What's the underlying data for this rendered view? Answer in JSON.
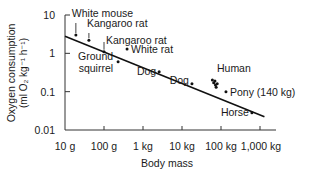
{
  "chart_data": {
    "type": "scatter",
    "title": "",
    "xlabel": "Body mass",
    "ylabel_line1": "Oxygen consumption",
    "ylabel_line2": "(ml O₂ kg⁻¹ h⁻¹)",
    "x_scale": "log",
    "y_scale": "log",
    "xlim_kg": [
      0.01,
      1300
    ],
    "ylim": [
      0.01,
      10
    ],
    "x_ticks": [
      {
        "value_kg": 0.01,
        "label": "10 g"
      },
      {
        "value_kg": 0.1,
        "label": "100 g"
      },
      {
        "value_kg": 1,
        "label": "1 kg"
      },
      {
        "value_kg": 10,
        "label": "10 kg"
      },
      {
        "value_kg": 100,
        "label": "100 kg"
      },
      {
        "value_kg": 1000,
        "label": "1,000 kg"
      }
    ],
    "y_ticks": [
      {
        "value": 10,
        "label": "10"
      },
      {
        "value": 1,
        "label": "1"
      },
      {
        "value": 0.1,
        "label": "0.1"
      },
      {
        "value": 0.01,
        "label": "0.01"
      }
    ],
    "grid": false,
    "legend": "none",
    "points": [
      {
        "label": "White mouse",
        "mass_kg": 0.019,
        "o2": 3.0
      },
      {
        "label": "Kangaroo rat",
        "mass_kg": 0.041,
        "o2": 2.2
      },
      {
        "label": "Kangaroo rat",
        "mass_kg": 0.1,
        "o2": 1.1
      },
      {
        "label": "White rat",
        "mass_kg": 0.39,
        "o2": 1.3
      },
      {
        "label": "Ground squirrel",
        "mass_kg": 0.23,
        "o2": 0.6
      },
      {
        "label": "Dog",
        "mass_kg": 2.6,
        "o2": 0.33
      },
      {
        "label": "Dog",
        "mass_kg": 18,
        "o2": 0.16
      },
      {
        "label": "Human",
        "mass_kg": 60,
        "o2": 0.2
      },
      {
        "label": "Human",
        "mass_kg": 65,
        "o2": 0.17
      },
      {
        "label": "Human",
        "mass_kg": 70,
        "o2": 0.19
      },
      {
        "label": "Human",
        "mass_kg": 72,
        "o2": 0.15
      },
      {
        "label": "Human",
        "mass_kg": 75,
        "o2": 0.13
      },
      {
        "label": "Human",
        "mass_kg": 80,
        "o2": 0.16
      },
      {
        "label": "Pony (140 kg)",
        "mass_kg": 134,
        "o2": 0.1
      },
      {
        "label": "Horse",
        "mass_kg": 620,
        "o2": 0.028
      }
    ],
    "annotations": [
      {
        "text": "White mouse",
        "mass_kg": 0.019,
        "o2": 3.0
      },
      {
        "text": "Kangaroo rat",
        "mass_kg": 0.041,
        "o2": 2.2
      },
      {
        "text": "Kangaroo rat",
        "mass_kg": 0.1,
        "o2": 1.1
      },
      {
        "text": "White rat",
        "mass_kg": 0.39,
        "o2": 1.3
      },
      {
        "text": "Ground",
        "mass_kg": 0.23,
        "o2": 0.6
      },
      {
        "text": "squirrel",
        "mass_kg": 0.23,
        "o2": 0.6
      },
      {
        "text": "Dog",
        "mass_kg": 2.6,
        "o2": 0.33
      },
      {
        "text": "Dog",
        "mass_kg": 18,
        "o2": 0.16
      },
      {
        "text": "Human",
        "mass_kg": 70,
        "o2": 0.19
      },
      {
        "text": "Pony (140 kg)",
        "mass_kg": 134,
        "o2": 0.1
      },
      {
        "text": "Horse",
        "mass_kg": 620,
        "o2": 0.028
      }
    ],
    "regression_line": {
      "from": {
        "mass_kg": 0.01,
        "o2": 2.8
      },
      "to": {
        "mass_kg": 1300,
        "o2": 0.022
      }
    }
  }
}
